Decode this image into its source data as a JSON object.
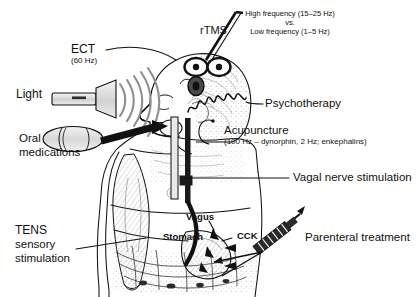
{
  "figure": {
    "type": "anatomical-treatment-diagram",
    "background_color": "#ffffff",
    "line_color": "#111111"
  },
  "labels": {
    "rtms": "rTMS",
    "rtms_note_line1": "High frequency (15–25 Hz)",
    "rtms_note_line2": "vs.",
    "rtms_note_line3": "Low frequency (1–5 Hz)",
    "ect": "ECT",
    "ect_freq": "(60 Hz)",
    "light": "Light",
    "oral_line1": "Oral",
    "oral_line2": "medications",
    "psychotherapy": "Psychotherapy",
    "acupuncture": "Acupuncture",
    "acupuncture_note": "(100 Hz – dynorphin, 2 Hz; enkephalins)",
    "vagal": "Vagal nerve stimulation",
    "tens_line1": "TENS",
    "tens_line2": "sensory",
    "tens_line3": "stimulation",
    "vagus": "Vagus",
    "stomach": "Stomach",
    "cck": "CCK",
    "parenteral": "Parenteral treatment"
  }
}
